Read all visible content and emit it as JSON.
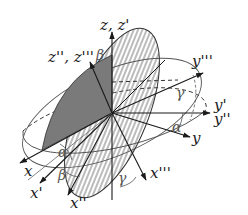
{
  "diagram": {
    "axes": {
      "z": "z, z'",
      "z2": "z'', z'''",
      "y3": "y'''",
      "y1": "y'",
      "y2": "y''",
      "y": "y",
      "x": "x",
      "x1": "x'",
      "x2": "x''",
      "x3": "x'''"
    },
    "angles": {
      "alpha_top": "α",
      "alpha_bottom": "α",
      "beta_top": "β",
      "beta_bottom": "β",
      "gamma_right": "γ",
      "gamma_bottom": "γ"
    },
    "colors": {
      "line": "#1a1a1a",
      "shaded_plane": "#7a7a7a",
      "hatch": "#555555",
      "ellipse": "#444444",
      "angle_label": "#555555"
    }
  }
}
